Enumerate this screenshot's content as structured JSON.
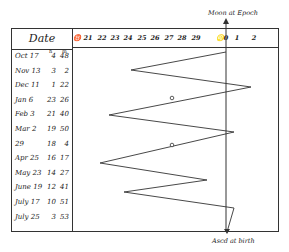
{
  "title_top": "Moon at Epoch",
  "title_bottom": "Ascd at birth",
  "table": {
    "header": "Date",
    "unit_labels": {
      "hours": "h",
      "minutes": "m"
    },
    "rows": [
      {
        "date": "Oct 17",
        "h": "4",
        "m": "48"
      },
      {
        "date": "Nov 13",
        "h": "3",
        "m": "2"
      },
      {
        "date": "Dec 11",
        "h": "1",
        "m": "22"
      },
      {
        "date": "Jan 6",
        "h": "23",
        "m": "26"
      },
      {
        "date": "Feb 3",
        "h": "21",
        "m": "40"
      },
      {
        "date": "Mar 2",
        "h": "19",
        "m": "50"
      },
      {
        "date": "29",
        "h": "18",
        "m": "4"
      },
      {
        "date": "Apr 25",
        "h": "16",
        "m": "17"
      },
      {
        "date": "May 23",
        "h": "14",
        "m": "27"
      },
      {
        "date": "June 19",
        "h": "12",
        "m": "41"
      },
      {
        "date": "July 17",
        "h": "10",
        "m": "51"
      },
      {
        "date": "July 25",
        "h": "3",
        "m": "53"
      }
    ]
  },
  "axis": {
    "ticks": [
      "♉",
      "21",
      "22",
      "23",
      "24",
      "25",
      "26",
      "27",
      "28",
      "29",
      "♌0",
      "1",
      "2"
    ]
  },
  "zigzag_points": [
    [
      226,
      52
    ],
    [
      131,
      70
    ],
    [
      251,
      87
    ],
    [
      109,
      115
    ],
    [
      234,
      132
    ],
    [
      100,
      163
    ],
    [
      207,
      180
    ],
    [
      124,
      192
    ],
    [
      234,
      208
    ],
    [
      227,
      232
    ]
  ],
  "circle_markers": [
    [
      172,
      98
    ],
    [
      172,
      145
    ]
  ],
  "colors": {
    "ink": "#333333",
    "paper": "#ffffff"
  }
}
